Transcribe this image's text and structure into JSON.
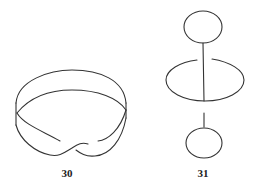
{
  "figures": [
    {
      "id": "fig-30",
      "label": "30",
      "description": "Mobius strip drawn as a twisted band",
      "label_pos": {
        "x": 67,
        "y": 167
      }
    },
    {
      "id": "fig-31",
      "label": "31",
      "description": "Two small loops linked through a large central ellipse by vertical line segments",
      "label_pos": {
        "x": 203,
        "y": 167
      }
    }
  ],
  "stroke_color": "#333333",
  "background": "#ffffff"
}
